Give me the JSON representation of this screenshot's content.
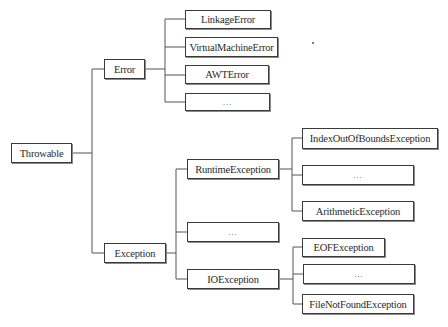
{
  "diagram": {
    "root": {
      "id": "throwable",
      "label": "Throwable"
    },
    "nodes": {
      "throwable": {
        "label": "Throwable"
      },
      "error": {
        "label": "Error"
      },
      "exception": {
        "label": "Exception"
      },
      "linkage_error": {
        "label": "LinkageError"
      },
      "virtual_machine_error": {
        "label": "VirtualMachineError"
      },
      "awt_error": {
        "label": "AWTError"
      },
      "error_more": {
        "label": "…"
      },
      "runtime_exception": {
        "label": "RuntimeException"
      },
      "exception_more": {
        "label": "…"
      },
      "io_exception": {
        "label": "IOException"
      },
      "index_out_of_bounds_exception": {
        "label": "IndexOutOfBoundsException"
      },
      "runtime_more": {
        "label": "…"
      },
      "arithmetic_exception": {
        "label": "ArithmeticException"
      },
      "eof_exception": {
        "label": "EOFException"
      },
      "io_more": {
        "label": "…"
      },
      "file_not_found_exception": {
        "label": "FileNotFoundException"
      }
    },
    "edges": [
      [
        "throwable",
        "error"
      ],
      [
        "throwable",
        "exception"
      ],
      [
        "error",
        "linkage_error"
      ],
      [
        "error",
        "virtual_machine_error"
      ],
      [
        "error",
        "awt_error"
      ],
      [
        "error",
        "error_more"
      ],
      [
        "exception",
        "runtime_exception"
      ],
      [
        "exception",
        "exception_more"
      ],
      [
        "exception",
        "io_exception"
      ],
      [
        "runtime_exception",
        "index_out_of_bounds_exception"
      ],
      [
        "runtime_exception",
        "runtime_more"
      ],
      [
        "runtime_exception",
        "arithmetic_exception"
      ],
      [
        "io_exception",
        "eof_exception"
      ],
      [
        "io_exception",
        "io_more"
      ],
      [
        "io_exception",
        "file_not_found_exception"
      ]
    ]
  }
}
